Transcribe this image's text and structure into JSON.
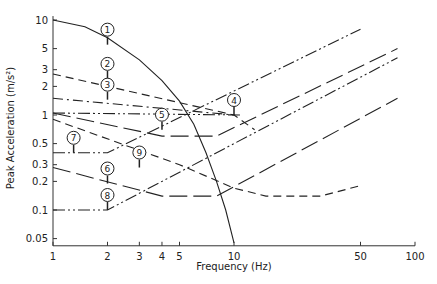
{
  "chart_data": {
    "type": "line",
    "title": "",
    "xlabel": "Frequency (Hz)",
    "ylabel": "Peak Acceleration (m/s²)",
    "xscale": "log",
    "yscale": "log",
    "xlim": [
      1,
      100
    ],
    "ylim": [
      0.04,
      12
    ],
    "x_ticks": [
      1,
      2,
      3,
      4,
      5,
      10,
      50,
      100
    ],
    "x_tick_labels": [
      "1",
      "2",
      "3",
      "4",
      "5",
      "10",
      "50",
      "100"
    ],
    "y_ticks": [
      0.05,
      0.1,
      0.2,
      0.3,
      0.5,
      1,
      2,
      3,
      5,
      10
    ],
    "y_tick_labels": [
      "0.05",
      "0.1",
      "0.2",
      "0.3",
      "0.5",
      "1",
      "2",
      "3",
      "5",
      "10"
    ],
    "grid": false,
    "legend": "numbered circle markers 1-9 on curves",
    "series": [
      {
        "name": "1",
        "style": "solid",
        "points": [
          [
            1,
            10
          ],
          [
            1.5,
            8.5
          ],
          [
            2,
            6.5
          ],
          [
            3,
            3.8
          ],
          [
            4,
            2.3
          ],
          [
            5,
            1.4
          ],
          [
            6,
            0.8
          ],
          [
            7,
            0.4
          ],
          [
            8,
            0.2
          ],
          [
            9,
            0.1
          ],
          [
            10,
            0.045
          ]
        ],
        "label_at": [
          2,
          5.5
        ]
      },
      {
        "name": "2",
        "style": "dash",
        "points": [
          [
            1,
            2.7
          ],
          [
            10,
            1.0
          ],
          [
            13,
            0.7
          ]
        ],
        "label_at": [
          2,
          2.4
        ]
      },
      {
        "name": "3",
        "style": "dashdot",
        "points": [
          [
            1,
            1.5
          ],
          [
            10,
            1.0
          ]
        ],
        "label_at": [
          2,
          1.45
        ]
      },
      {
        "name": "4",
        "style": "dashdotdot",
        "points": [
          [
            1,
            1.05
          ],
          [
            11,
            1.0
          ]
        ],
        "label_at": [
          10,
          1.0
        ]
      },
      {
        "name": "5",
        "style": "longdash",
        "points": [
          [
            1,
            1.05
          ],
          [
            4,
            0.6
          ],
          [
            8,
            0.6
          ],
          [
            80,
            5.0
          ]
        ],
        "label_at": [
          4,
          0.7
        ]
      },
      {
        "name": "6",
        "style": "longdash",
        "points": [
          [
            1,
            0.28
          ],
          [
            4,
            0.14
          ],
          [
            8,
            0.14
          ],
          [
            80,
            1.5
          ]
        ],
        "label_at": [
          2,
          0.19
        ]
      },
      {
        "name": "7",
        "style": "dashdotdot",
        "points": [
          [
            1,
            0.4
          ],
          [
            2,
            0.4
          ],
          [
            50,
            8.0
          ]
        ],
        "label_at": [
          1.3,
          0.4
        ]
      },
      {
        "name": "8",
        "style": "dashdotdot",
        "points": [
          [
            1,
            0.1
          ],
          [
            2,
            0.1
          ],
          [
            80,
            4.0
          ]
        ],
        "label_at": [
          2,
          0.1
        ]
      },
      {
        "name": "9",
        "style": "dash",
        "points": [
          [
            1,
            0.9
          ],
          [
            5,
            0.3
          ],
          [
            10,
            0.17
          ],
          [
            15,
            0.14
          ],
          [
            30,
            0.14
          ],
          [
            50,
            0.18
          ]
        ],
        "label_at": [
          3,
          0.28
        ]
      }
    ]
  }
}
